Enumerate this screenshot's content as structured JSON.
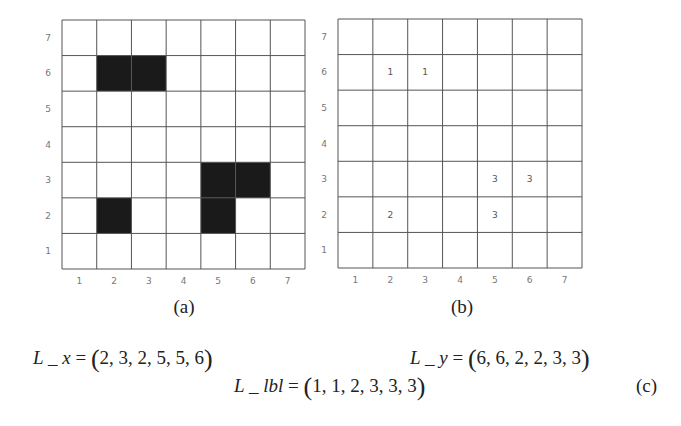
{
  "figure_a": {
    "caption": "(a)",
    "rows": 7,
    "cols": 7,
    "x_ticks": [
      "1",
      "2",
      "3",
      "4",
      "5",
      "6",
      "7"
    ],
    "y_ticks": [
      "1",
      "2",
      "3",
      "4",
      "5",
      "6",
      "7"
    ],
    "filled_cells": [
      {
        "x": 2,
        "y": 6
      },
      {
        "x": 3,
        "y": 6
      },
      {
        "x": 2,
        "y": 2
      },
      {
        "x": 5,
        "y": 2
      },
      {
        "x": 5,
        "y": 3
      },
      {
        "x": 6,
        "y": 3
      }
    ],
    "fill_color": "#1a1a1a",
    "line_color": "#555555"
  },
  "figure_b": {
    "caption": "(b)",
    "rows": 7,
    "cols": 7,
    "x_ticks": [
      "1",
      "2",
      "3",
      "4",
      "5",
      "6",
      "7"
    ],
    "y_ticks": [
      "1",
      "2",
      "3",
      "4",
      "5",
      "6",
      "7"
    ],
    "labeled_cells": [
      {
        "x": 2,
        "y": 6,
        "label": "1"
      },
      {
        "x": 3,
        "y": 6,
        "label": "1"
      },
      {
        "x": 2,
        "y": 2,
        "label": "2"
      },
      {
        "x": 5,
        "y": 3,
        "label": "3"
      },
      {
        "x": 6,
        "y": 3,
        "label": "3"
      },
      {
        "x": 5,
        "y": 2,
        "label": "3"
      }
    ],
    "line_color": "#555555"
  },
  "equations": {
    "lx": {
      "var": "L _ x",
      "eq": " = ",
      "values": "2, 3, 2, 5, 5, 6"
    },
    "ly": {
      "var": "L _ y",
      "eq": " = ",
      "values": "6, 6, 2, 2, 3, 3"
    },
    "llbl": {
      "var": "L _ lbl",
      "eq": " = ",
      "values": "1, 1, 2, 3, 3, 3"
    },
    "caption": "(c)",
    "open_paren": "(",
    "close_paren": ")"
  }
}
